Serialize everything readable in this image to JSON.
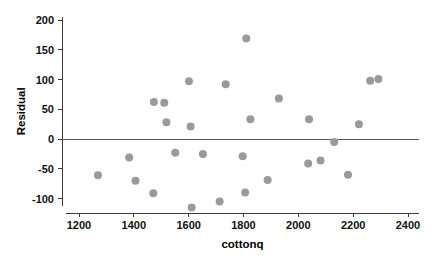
{
  "chart_data": {
    "type": "scatter",
    "title": "",
    "xlabel": "cottonq",
    "ylabel": "Residual",
    "xlim": [
      1150,
      2430
    ],
    "ylim": [
      -132,
      205
    ],
    "xticks": [
      1200,
      1400,
      1600,
      1800,
      2000,
      2200,
      2400
    ],
    "xtick_labels": [
      "1200",
      "1400",
      "1600",
      "1800",
      "2000",
      "2200",
      "2400"
    ],
    "yticks": [
      200,
      150,
      100,
      50,
      0,
      -50,
      -100
    ],
    "ytick_labels": [
      "200",
      "150",
      "100",
      "50",
      "0",
      "-50",
      "-100"
    ],
    "grid": false,
    "legend": false,
    "marker_color": "#9a9a9a",
    "marker_size": 4,
    "reference_line": {
      "orientation": "horizontal",
      "y": 0,
      "color": "#555555"
    },
    "series": [
      {
        "name": "Residuals",
        "points": [
          {
            "x": 1269,
            "y": -61
          },
          {
            "x": 1383,
            "y": -31
          },
          {
            "x": 1406,
            "y": -70
          },
          {
            "x": 1471,
            "y": -91
          },
          {
            "x": 1473,
            "y": 62
          },
          {
            "x": 1511,
            "y": 61
          },
          {
            "x": 1519,
            "y": 28
          },
          {
            "x": 1551,
            "y": -23
          },
          {
            "x": 1601,
            "y": 97
          },
          {
            "x": 1607,
            "y": 21
          },
          {
            "x": 1611,
            "y": -115
          },
          {
            "x": 1652,
            "y": -25
          },
          {
            "x": 1713,
            "y": -105
          },
          {
            "x": 1735,
            "y": 92
          },
          {
            "x": 1797,
            "y": -29
          },
          {
            "x": 1806,
            "y": -90
          },
          {
            "x": 1810,
            "y": 169
          },
          {
            "x": 1825,
            "y": 33
          },
          {
            "x": 1888,
            "y": -69
          },
          {
            "x": 1929,
            "y": 68
          },
          {
            "x": 2036,
            "y": -41
          },
          {
            "x": 2039,
            "y": 33
          },
          {
            "x": 2081,
            "y": -36
          },
          {
            "x": 2131,
            "y": -5
          },
          {
            "x": 2181,
            "y": -60
          },
          {
            "x": 2221,
            "y": 25
          },
          {
            "x": 2262,
            "y": 98
          },
          {
            "x": 2292,
            "y": 101
          }
        ]
      }
    ]
  }
}
